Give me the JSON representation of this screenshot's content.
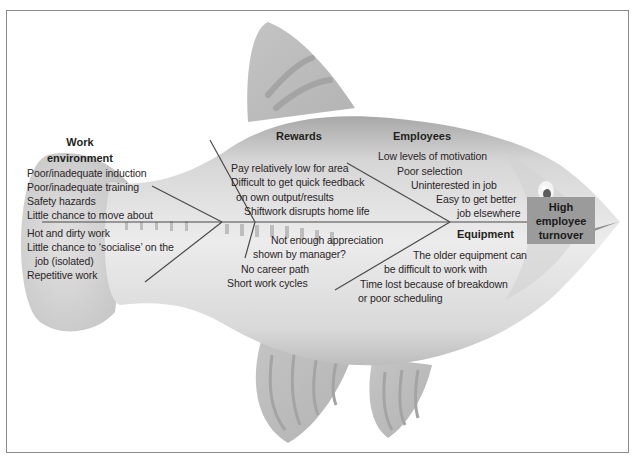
{
  "diagram": {
    "type": "fishbone (Ishikawa) cause-and-effect diagram",
    "effect": {
      "lines": [
        "High",
        "employee",
        "turnover"
      ]
    },
    "categories": [
      {
        "name_lines": [
          "Work",
          "environment"
        ],
        "causes": [
          "Poor/inadequate induction",
          "Poor/inadequate training",
          "Safety hazards",
          "Little chance to move about",
          "Hot and dirty work",
          "Little chance to ‘socialise’ on the",
          "job (isolated)",
          "Repetitive work"
        ]
      },
      {
        "name": "Rewards",
        "causes": [
          "Pay relatively low for area",
          "Difficult to get quick feedback",
          "on own output/results",
          "Shiftwork disrupts home life",
          "Not enough appreciation",
          "shown by manager?",
          "No career path",
          "Short work cycles"
        ]
      },
      {
        "name": "Employees",
        "causes": [
          "Low levels of motivation",
          "Poor selection",
          "Uninterested in job",
          "Easy to get better",
          "job elsewhere"
        ]
      },
      {
        "name": "Equipment",
        "causes": [
          "The older equipment can",
          "be difficult to work with",
          "Time lost because of breakdown",
          "or poor scheduling"
        ]
      }
    ],
    "colors": {
      "fish_light": "#e4e4e4",
      "fish_mid": "#c8c8c8",
      "fish_dark": "#a9a9a9",
      "effect_box": "#9b9b9b",
      "lines": "#4a4a4a",
      "frame": "#8a8a8a"
    }
  }
}
